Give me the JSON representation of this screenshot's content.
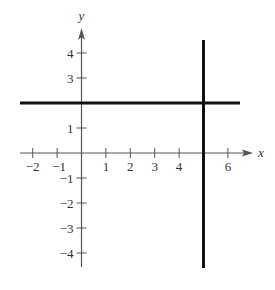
{
  "chart_data": {
    "type": "line",
    "title": "",
    "xlabel": "x",
    "ylabel": "y",
    "xlim": [
      -2.4,
      7
    ],
    "ylim": [
      -4.6,
      5
    ],
    "grid": false,
    "x_ticks": [
      -2,
      -1,
      1,
      2,
      3,
      4,
      6
    ],
    "x_tick_labels": [
      "−2",
      "−1",
      "1",
      "2",
      "3",
      "4",
      "6"
    ],
    "y_ticks": [
      -4,
      -3,
      -2,
      -1,
      1,
      3,
      4
    ],
    "y_tick_labels": [
      "−4",
      "−3",
      "−2",
      "−1",
      "1",
      "3",
      "4"
    ],
    "series": [
      {
        "name": "horizontal line y = 2",
        "equation": "y = 2",
        "x": [
          -2.5,
          6.5
        ],
        "y": [
          2,
          2
        ]
      },
      {
        "name": "vertical line x = 5",
        "equation": "x = 5",
        "x": [
          5,
          5
        ],
        "y": [
          -4.6,
          4.5
        ]
      }
    ],
    "colors": {
      "axis": "#555555",
      "lines": "#111111",
      "labels": "#333333"
    }
  }
}
